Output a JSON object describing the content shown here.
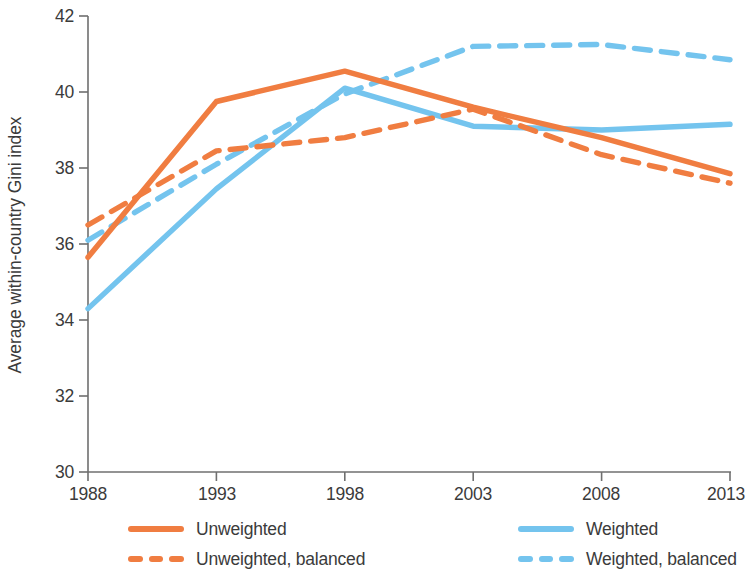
{
  "chart_data": {
    "type": "line",
    "title": "",
    "xlabel": "",
    "ylabel": "Average within-country Gini index",
    "x": [
      1988,
      1993,
      1998,
      2003,
      2008,
      2013
    ],
    "xticklabels": [
      "1988",
      "1993",
      "1998",
      "2003",
      "2008",
      "2013"
    ],
    "yticklabels": [
      "30",
      "32",
      "34",
      "36",
      "38",
      "40",
      "42"
    ],
    "yticks": [
      30,
      32,
      34,
      36,
      38,
      40,
      42
    ],
    "xlim": [
      1988,
      2013
    ],
    "ylim": [
      30,
      42
    ],
    "grid": false,
    "legend_position": "bottom",
    "series": [
      {
        "name": "Unweighted",
        "color": "#f07d41",
        "style": "solid",
        "values": [
          35.65,
          39.75,
          40.55,
          39.6,
          38.8,
          37.85
        ]
      },
      {
        "name": "Unweighted, balanced",
        "color": "#f07d41",
        "style": "dashed",
        "values": [
          36.5,
          38.45,
          38.8,
          39.55,
          38.35,
          37.6
        ]
      },
      {
        "name": "Weighted",
        "color": "#74c4ee",
        "style": "solid",
        "values": [
          34.3,
          37.45,
          40.1,
          39.1,
          39.0,
          39.15
        ]
      },
      {
        "name": "Weighted, balanced",
        "color": "#74c4ee",
        "style": "dashed",
        "values": [
          36.1,
          38.1,
          39.95,
          41.2,
          41.25,
          40.85
        ]
      }
    ]
  },
  "axis": {
    "y_title": "Average within-country Gini index",
    "y_ticks": [
      "42",
      "40",
      "38",
      "36",
      "34",
      "32",
      "30"
    ],
    "x_ticks": [
      "1988",
      "1993",
      "1998",
      "2003",
      "2008",
      "2013"
    ]
  },
  "legend": {
    "items": [
      {
        "label": "Unweighted",
        "color": "#f07d41",
        "style": "solid"
      },
      {
        "label": "Weighted",
        "color": "#74c4ee",
        "style": "solid"
      },
      {
        "label": "Unweighted, balanced",
        "color": "#f07d41",
        "style": "dashed"
      },
      {
        "label": "Weighted, balanced",
        "color": "#74c4ee",
        "style": "dashed"
      }
    ]
  },
  "colors": {
    "orange": "#f07d41",
    "blue": "#74c4ee",
    "axis": "#6f6f6f",
    "text": "#3b3b3b"
  }
}
